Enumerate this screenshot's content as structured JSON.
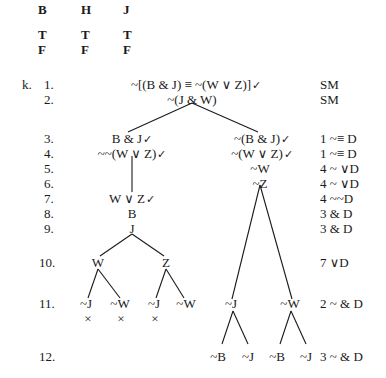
{
  "truth_table": {
    "headers": [
      "B",
      "H",
      "J"
    ],
    "rows": [
      [
        "T",
        "T",
        "T"
      ],
      [
        "F",
        "F",
        "F"
      ]
    ]
  },
  "problem_label": "k.",
  "check": "✓",
  "close": "×",
  "lines": [
    {
      "num": "1.",
      "justification": "SM"
    },
    {
      "num": "2.",
      "justification": "SM"
    },
    {
      "num": "3.",
      "justification": "1  ~≡ D"
    },
    {
      "num": "4.",
      "justification": "1  ~≡ D"
    },
    {
      "num": "5.",
      "justification": "4  ~ ∨D"
    },
    {
      "num": "6.",
      "justification": "4  ~ ∨D"
    },
    {
      "num": "7.",
      "justification": "4  ~~D"
    },
    {
      "num": "8.",
      "justification": "3  & D"
    },
    {
      "num": "9.",
      "justification": "3  & D"
    },
    {
      "num": "10.",
      "justification": "7  ∨D"
    },
    {
      "num": "11.",
      "justification": "2  ~ & D"
    },
    {
      "num": "12.",
      "justification": "3  ~ & D"
    }
  ],
  "tree": {
    "trunk": [
      "~[(B & J) ≡ ~(W ∨ Z)]",
      "~(J & W)"
    ],
    "left": {
      "l3": "B & J",
      "l4": "~~(W ∨ Z)",
      "l7": "W ∨ Z",
      "l8": "B",
      "l9": "J",
      "l10": [
        "W",
        "Z"
      ],
      "l11": [
        "~J",
        "~W",
        "~J",
        "~W"
      ]
    },
    "right": {
      "l3": "~(B & J)",
      "l4": "~(W ∨ Z)",
      "l5": "~W",
      "l6": "~Z",
      "l11": [
        "~J",
        "~W"
      ],
      "l12": [
        "~B",
        "~J",
        "~B",
        "~J"
      ]
    }
  }
}
